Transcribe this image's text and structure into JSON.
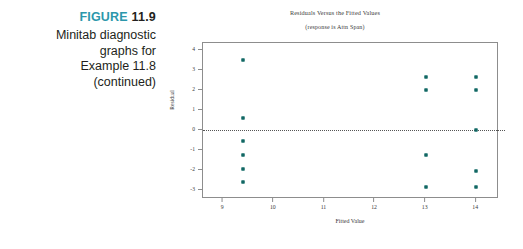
{
  "figure": {
    "label_word": "FIGURE",
    "label_number": "11.9",
    "label_color": "#2c97ab",
    "caption_lines": [
      "Minitab diagnostic",
      "graphs for",
      "Example 11.8",
      "(continued)"
    ]
  },
  "chart_data": {
    "type": "scatter",
    "title": "Residuals Versus the Fitted Values",
    "subtitle": "(response is Attn Span)",
    "xlabel": "Fitted Value",
    "ylabel": "Residual",
    "xlim": [
      8.6,
      14.45
    ],
    "ylim": [
      -3.45,
      4.35
    ],
    "xticks": [
      "9",
      "10",
      "11",
      "12",
      "13",
      "14"
    ],
    "xtick_values": [
      9,
      10,
      11,
      12,
      13,
      14
    ],
    "yticks": [
      "4",
      "3",
      "2",
      "1",
      "0",
      "-1",
      "-2",
      "-3"
    ],
    "ytick_values": [
      4,
      3,
      2,
      1,
      0,
      -1,
      -2,
      -3
    ],
    "grid": false,
    "legend": "none",
    "reference_line": {
      "axis": "y",
      "value": 0,
      "style": "dotted"
    },
    "marker_color": "#1d7f7a",
    "points": [
      {
        "x": 9.4,
        "y": 3.5
      },
      {
        "x": 9.4,
        "y": 0.6
      },
      {
        "x": 9.4,
        "y": -0.55
      },
      {
        "x": 9.4,
        "y": -1.25
      },
      {
        "x": 9.4,
        "y": -1.95
      },
      {
        "x": 9.4,
        "y": -2.6
      },
      {
        "x": 13.0,
        "y": 2.65
      },
      {
        "x": 13.0,
        "y": 2.0
      },
      {
        "x": 13.0,
        "y": -1.25
      },
      {
        "x": 13.0,
        "y": -2.85
      },
      {
        "x": 14.0,
        "y": 2.65
      },
      {
        "x": 14.0,
        "y": 2.0
      },
      {
        "x": 14.0,
        "y": 0.0
      },
      {
        "x": 14.0,
        "y": -2.05
      },
      {
        "x": 14.0,
        "y": -2.85
      }
    ]
  }
}
